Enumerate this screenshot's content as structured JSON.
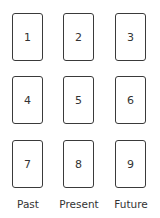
{
  "spread": {
    "cards": [
      {
        "number": "1",
        "row": 0,
        "col": 0
      },
      {
        "number": "2",
        "row": 0,
        "col": 1
      },
      {
        "number": "3",
        "row": 0,
        "col": 2
      },
      {
        "number": "4",
        "row": 1,
        "col": 0
      },
      {
        "number": "5",
        "row": 1,
        "col": 1
      },
      {
        "number": "6",
        "row": 1,
        "col": 2
      },
      {
        "number": "7",
        "row": 2,
        "col": 0
      },
      {
        "number": "8",
        "row": 2,
        "col": 1
      },
      {
        "number": "9",
        "row": 2,
        "col": 2
      }
    ],
    "column_labels": [
      "Past",
      "Present",
      "Future"
    ]
  }
}
